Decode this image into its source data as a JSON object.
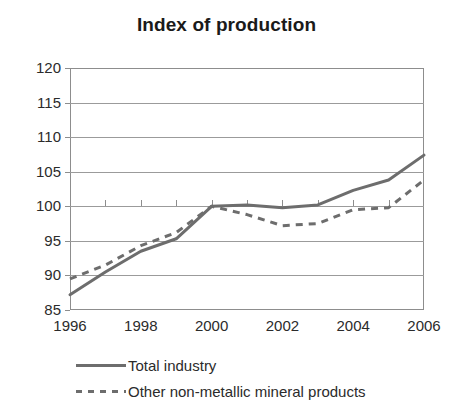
{
  "chart_data": {
    "type": "line",
    "title": "Index of production",
    "xlabel": "",
    "ylabel": "",
    "x": [
      1996,
      1997,
      1998,
      1999,
      2000,
      2001,
      2002,
      2003,
      2004,
      2005,
      2006
    ],
    "xlim": [
      1996,
      2006
    ],
    "ylim": [
      85,
      120
    ],
    "xticks": [
      1996,
      1997,
      1998,
      1999,
      2000,
      2001,
      2002,
      2003,
      2004,
      2005,
      2006
    ],
    "xtick_labels": [
      "1996",
      "",
      "1998",
      "",
      "2000",
      "",
      "2002",
      "",
      "2004",
      "",
      "2006"
    ],
    "yticks": [
      85,
      90,
      95,
      100,
      105,
      110,
      115,
      120
    ],
    "ytick_labels": [
      "85",
      "90",
      "95",
      "100",
      "105",
      "110",
      "115",
      "120"
    ],
    "grid": "horizontal",
    "legend_position": "bottom-left",
    "series": [
      {
        "name": "Total industry",
        "style": "solid",
        "color": "#6d6d6d",
        "values": [
          87.2,
          90.5,
          93.5,
          95.3,
          100.0,
          100.2,
          99.8,
          100.2,
          102.3,
          103.8,
          107.4
        ]
      },
      {
        "name": "Other non-metallic mineral products",
        "style": "dashed",
        "color": "#6d6d6d",
        "values": [
          89.5,
          91.5,
          94.3,
          96.2,
          100.0,
          98.8,
          97.2,
          97.5,
          99.5,
          99.8,
          103.8
        ]
      }
    ]
  },
  "legend": [
    {
      "label": "Total industry",
      "style": "solid"
    },
    {
      "label": "Other non-metallic mineral products",
      "style": "dashed"
    }
  ],
  "colors": {
    "line": "#6d6d6d",
    "axis": "#8d8d8d",
    "grid": "#9b9b9b",
    "text": "#2b2b2b",
    "title": "#1a1a1a",
    "background": "#ffffff"
  }
}
